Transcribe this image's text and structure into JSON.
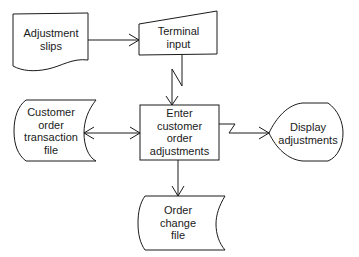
{
  "diagram": {
    "type": "system flowchart",
    "nodes": {
      "adjustment_slips": {
        "shape": "document",
        "label": "Adjustment\nslips"
      },
      "terminal_input": {
        "shape": "manual-input",
        "label": "Terminal\ninput"
      },
      "customer_order_file": {
        "shape": "online-storage",
        "label": "Customer\norder\ntransaction\nfile"
      },
      "process": {
        "shape": "process",
        "label": "Enter\ncustomer\norder\nadjustments"
      },
      "display": {
        "shape": "display",
        "label": "Display\nadjustments"
      },
      "order_change_file": {
        "shape": "online-storage",
        "label": "Order\nchange\nfile"
      }
    },
    "edges": [
      {
        "from": "adjustment_slips",
        "to": "terminal_input",
        "style": "arrow"
      },
      {
        "from": "terminal_input",
        "to": "process",
        "style": "communication-link"
      },
      {
        "from": "customer_order_file",
        "to": "process",
        "style": "bidirectional-arrow"
      },
      {
        "from": "process",
        "to": "display",
        "style": "communication-link"
      },
      {
        "from": "process",
        "to": "order_change_file",
        "style": "arrow"
      }
    ]
  }
}
